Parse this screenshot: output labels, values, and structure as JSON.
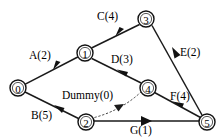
{
  "diagram": {
    "background_color": "#ffffff",
    "line_color": "#111111",
    "dummy_line_color": "#3a3a3a",
    "nodes": [
      {
        "id": "node-0",
        "label": "0",
        "cx": 18,
        "cy": 88
      },
      {
        "id": "node-1",
        "label": "1",
        "cx": 85,
        "cy": 53
      },
      {
        "id": "node-2",
        "label": "2",
        "cx": 86,
        "cy": 122
      },
      {
        "id": "node-3",
        "label": "3",
        "cx": 146,
        "cy": 19
      },
      {
        "id": "node-4",
        "label": "4",
        "cx": 148,
        "cy": 88
      },
      {
        "id": "node-5",
        "label": "5",
        "cx": 207,
        "cy": 122
      }
    ],
    "edges": [
      {
        "id": "edge-a",
        "label": "A(2)",
        "from": "0",
        "to": "1",
        "duration": 2,
        "style": "solid",
        "label_x": 29,
        "label_y": 50
      },
      {
        "id": "edge-b",
        "label": "B(5)",
        "from": "0",
        "to": "2",
        "duration": 5,
        "style": "solid",
        "label_x": 31,
        "label_y": 110
      },
      {
        "id": "edge-c",
        "label": "C(4)",
        "from": "1",
        "to": "3",
        "duration": 4,
        "style": "solid",
        "label_x": 97,
        "label_y": 11
      },
      {
        "id": "edge-d",
        "label": "D(3)",
        "from": "1",
        "to": "4",
        "duration": 3,
        "style": "solid",
        "label_x": 111,
        "label_y": 54
      },
      {
        "id": "edge-e",
        "label": "E(2)",
        "from": "3",
        "to": "5",
        "duration": 2,
        "style": "solid",
        "label_x": 180,
        "label_y": 47
      },
      {
        "id": "edge-f",
        "label": "F(4)",
        "from": "4",
        "to": "5",
        "duration": 4,
        "style": "solid",
        "label_x": 170,
        "label_y": 91
      },
      {
        "id": "edge-g",
        "label": "G(1)",
        "from": "2",
        "to": "5",
        "duration": 1,
        "style": "solid",
        "label_x": 130,
        "label_y": 125
      },
      {
        "id": "edge-dummy",
        "label": "Dummy(0)",
        "from": "2",
        "to": "4",
        "duration": 0,
        "style": "dashed",
        "label_x": 62,
        "label_y": 90
      }
    ]
  }
}
